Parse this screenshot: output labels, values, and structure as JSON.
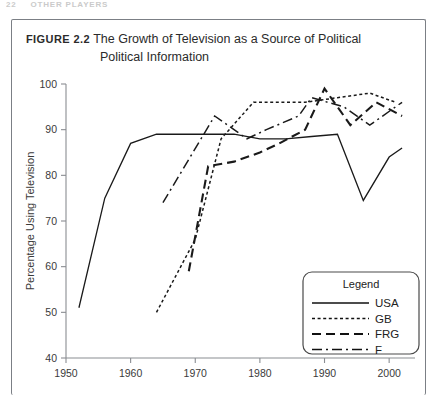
{
  "page_header": {
    "page_number": "22",
    "running_head": "OTHER PLAYERS"
  },
  "figure": {
    "number_label": "Figure 2.2",
    "caption_line1": "The Growth of Television as a Source of Political",
    "caption_line2": "Political Information"
  },
  "legend": {
    "title": "Legend"
  },
  "chart_data": {
    "type": "line",
    "title": "The Growth of Television as a Source of Political Political Information",
    "xlabel": "",
    "ylabel": "Percentage Using Television",
    "xlim": [
      1950,
      2004
    ],
    "ylim": [
      40,
      100
    ],
    "xticks": [
      1950,
      1960,
      1970,
      1980,
      1990,
      2000
    ],
    "xtick_labels": [
      "1950",
      "1960",
      "1970",
      "1980",
      "1990",
      "2000"
    ],
    "yticks": [
      40,
      50,
      60,
      70,
      80,
      90,
      100
    ],
    "ytick_labels": [
      "40",
      "50",
      "60",
      "70",
      "80",
      "90",
      "100"
    ],
    "grid": false,
    "legend_position": "lower-right",
    "series": [
      {
        "name": "USA",
        "style": "solid",
        "dasharray": "",
        "stroke_width": 1.3,
        "x": [
          1952,
          1956,
          1960,
          1964,
          1968,
          1972,
          1976,
          1980,
          1984,
          1988,
          1992,
          1996,
          2000,
          2002
        ],
        "y": [
          51,
          75,
          87,
          89,
          89,
          89,
          89,
          88,
          88,
          88.5,
          89,
          74.5,
          84,
          86
        ]
      },
      {
        "name": "GB",
        "style": "dotted",
        "dasharray": "3,2.6",
        "stroke_width": 1.5,
        "x": [
          1964,
          1970,
          1974,
          1979,
          1983,
          1987,
          1992,
          1997,
          2001
        ],
        "y": [
          50,
          66,
          88,
          96,
          96,
          96,
          97,
          98,
          96
        ]
      },
      {
        "name": "FRG",
        "style": "long-dash",
        "dasharray": "9,5",
        "stroke_width": 2.1,
        "x": [
          1969,
          1972,
          1976,
          1980,
          1983,
          1987,
          1990,
          1994,
          1998,
          2002
        ],
        "y": [
          59,
          82,
          83,
          85,
          87,
          90,
          99,
          91,
          96,
          93
        ]
      },
      {
        "name": "F",
        "style": "dash-dot",
        "dasharray": "10,4,2,4",
        "stroke_width": 1.5,
        "x": [
          1965,
          1973,
          1978,
          1981,
          1986,
          1988,
          1993,
          1997,
          2002
        ],
        "y": [
          74,
          93,
          88,
          90,
          93,
          97,
          95,
          91,
          96
        ]
      }
    ]
  }
}
